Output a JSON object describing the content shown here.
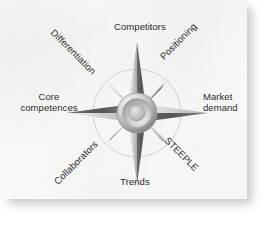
{
  "figure": {
    "name": "strategy-compass",
    "type": "compass-rose-diagram",
    "center_hub_label": "",
    "background_color": "#fcfcfb",
    "page_color": "#ffffff",
    "text_color": "#2b2b2b"
  },
  "compass": {
    "points": [
      {
        "id": "n",
        "direction": "north",
        "label": "Competitors",
        "angle_deg": 0,
        "orientation": "horizontal"
      },
      {
        "id": "ne",
        "direction": "northeast",
        "label": "Positioning",
        "angle_deg": 45,
        "orientation": "rotated-45"
      },
      {
        "id": "e",
        "direction": "east",
        "label": "Market demand",
        "angle_deg": 90,
        "orientation": "horizontal"
      },
      {
        "id": "se",
        "direction": "southeast",
        "label": "STEEPLE",
        "angle_deg": 135,
        "orientation": "rotated+45"
      },
      {
        "id": "s",
        "direction": "south",
        "label": "Trends",
        "angle_deg": 180,
        "orientation": "horizontal"
      },
      {
        "id": "sw",
        "direction": "southwest",
        "label": "Collaborators",
        "angle_deg": 225,
        "orientation": "rotated-45"
      },
      {
        "id": "w",
        "direction": "west",
        "label": "Core competences",
        "angle_deg": 270,
        "orientation": "horizontal"
      },
      {
        "id": "nw",
        "direction": "northwest",
        "label": "Differentiation",
        "angle_deg": 315,
        "orientation": "rotated+45"
      }
    ],
    "label_market_demand_line1": "Market",
    "label_market_demand_line2": "demand",
    "label_core_competences_line1": "Core",
    "label_core_competences_line2": "competences",
    "ring_visible": true,
    "hub_rings": 3,
    "style": "metallic-grayscale"
  }
}
